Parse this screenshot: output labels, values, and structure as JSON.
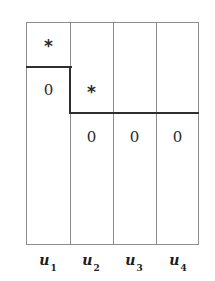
{
  "figure": {
    "background_color": "#ffffff",
    "thin_line_color": "#8d8d8d",
    "thick_line_color": "#2e2e2e",
    "text_color": "#2a2a2a"
  },
  "columns": [
    {
      "id": "u1",
      "label_base": "u",
      "label_sub": "1"
    },
    {
      "id": "u2",
      "label_base": "u",
      "label_sub": "2"
    },
    {
      "id": "u3",
      "label_base": "u",
      "label_sub": "3"
    },
    {
      "id": "u4",
      "label_base": "u",
      "label_sub": "4"
    }
  ],
  "entries": {
    "c1_star": "*",
    "c1_zero": "0",
    "c2_star": "*",
    "c2_zero": "0",
    "c3_zero": "0",
    "c4_zero": "0"
  }
}
